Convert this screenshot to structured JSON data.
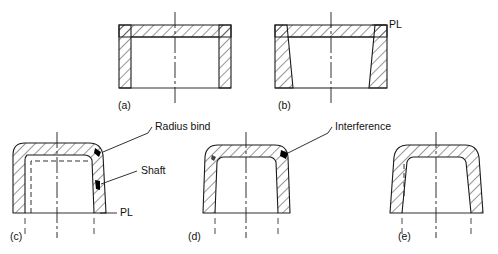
{
  "figure": {
    "title": "",
    "type": "engineering-cross-section-drawing",
    "background_color": "#ffffff",
    "line_color": "#1a1a1a",
    "hatch_color": "#1a1a1a",
    "interference_mark_color": "#000000"
  },
  "subfigures": [
    {
      "id": "a",
      "label": "(a)",
      "description": "straight-wall cap cross-section, no draft",
      "label_x": 118,
      "label_y": 109
    },
    {
      "id": "b",
      "label": "(b)",
      "description": "drafted-wall cap cross-section with parting line",
      "label_x": 278,
      "label_y": 109
    },
    {
      "id": "c",
      "label": "(c)",
      "description": "radiused cap with shaft and radius bind callouts",
      "label_x": 10,
      "label_y": 240
    },
    {
      "id": "d",
      "label": "(d)",
      "description": "radiused cap showing interference at corner",
      "label_x": 188,
      "label_y": 240
    },
    {
      "id": "e",
      "label": "(e)",
      "description": "fully drafted radiused cap, no interference",
      "label_x": 398,
      "label_y": 240
    }
  ],
  "annotations": [
    {
      "id": "radius-bind",
      "text": "Radius bind",
      "x": 152,
      "y": 130,
      "leader_from_x": 148,
      "leader_from_y": 133,
      "leader_to_x": 103,
      "leader_to_y": 152
    },
    {
      "id": "shaft",
      "text": "Shaft",
      "x": 141,
      "y": 174,
      "leader_from_x": 137,
      "leader_from_y": 171,
      "leader_to_x": 101,
      "leader_to_y": 184
    },
    {
      "id": "interference",
      "text": "Interference",
      "x": 332,
      "y": 130,
      "leader_from_x": 328,
      "leader_from_y": 133,
      "leader_to_x": 288,
      "leader_to_y": 153
    },
    {
      "id": "pl-b",
      "text": "PL",
      "x": 389,
      "y": 28,
      "leader_from_x": 386,
      "leader_from_y": 25,
      "leader_to_x": 372,
      "leader_to_y": 25
    },
    {
      "id": "pl-c",
      "text": "PL",
      "x": 120,
      "y": 216,
      "leader_from_x": 117,
      "leader_from_y": 213,
      "leader_to_x": 100,
      "leader_to_y": 213
    }
  ],
  "legend_terms": {
    "pl": "PL",
    "pl_meaning": "Parting Line",
    "radius_bind": "Radius bind",
    "shaft": "Shaft",
    "interference": "Interference"
  }
}
